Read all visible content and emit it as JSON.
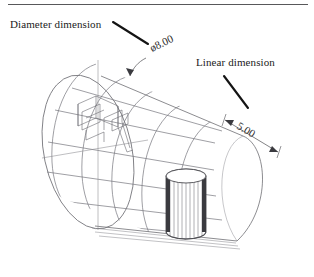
{
  "figure": {
    "title_rule": true,
    "background_color": "#ffffff",
    "line_color": "#6b6b70",
    "leader_color": "#141414",
    "text_color": "#1b1b1b"
  },
  "annotations": {
    "diameter_label": "Diameter dimension",
    "linear_label": "Linear dimension"
  },
  "dimensions": {
    "diameter_value": "ø8.00",
    "linear_value": "5.00"
  },
  "icons": {
    "diameter_leader": "leader-line-icon",
    "linear_leader": "leader-line-icon",
    "diameter_arrow": "arrowhead-icon",
    "linear_arrow_left": "arrowhead-icon",
    "linear_arrow_right": "arrowhead-icon"
  },
  "model": {
    "shape": "cylinder-wireframe",
    "features": [
      "internal-slot-pocket",
      "vertical-drilled-hole"
    ]
  }
}
